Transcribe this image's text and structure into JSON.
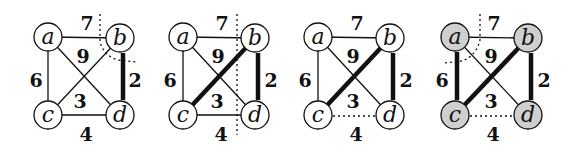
{
  "colors": {
    "stroke": "#111111",
    "node_fill": "#ffffff",
    "node_fill_in_tree": "#cfcfcf",
    "background": "#ffffff"
  },
  "nodes": [
    "a",
    "b",
    "c",
    "d"
  ],
  "edges": [
    {
      "id": "ab",
      "from": "a",
      "to": "b",
      "weight": "7"
    },
    {
      "id": "ad",
      "from": "a",
      "to": "d",
      "weight": "9"
    },
    {
      "id": "ac",
      "from": "a",
      "to": "c",
      "weight": "6"
    },
    {
      "id": "bd",
      "from": "b",
      "to": "d",
      "weight": "2"
    },
    {
      "id": "bc",
      "from": "b",
      "to": "c",
      "weight": "3"
    },
    {
      "id": "cd",
      "from": "c",
      "to": "d",
      "weight": "4"
    }
  ],
  "panels": [
    {
      "index": 1,
      "label_a": "a",
      "label_b": "b",
      "label_c": "c",
      "label_d": "d",
      "w_ab": "7",
      "w_ad": "9",
      "w_ac": "6",
      "w_bd": "2",
      "w_bc": "3",
      "w_cd": "4",
      "tree_edges": [
        "bd"
      ],
      "dotted_edges": [],
      "shaded_nodes": [],
      "cut": "around b"
    },
    {
      "index": 2,
      "label_a": "a",
      "label_b": "b",
      "label_c": "c",
      "label_d": "d",
      "w_ab": "7",
      "w_ad": "9",
      "w_ac": "6",
      "w_bd": "2",
      "w_bc": "3",
      "w_cd": "4",
      "tree_edges": [
        "bd",
        "bc"
      ],
      "dotted_edges": [],
      "shaded_nodes": [],
      "cut": "vertical line between {a,c} and {b,d}"
    },
    {
      "index": 3,
      "label_a": "a",
      "label_b": "b",
      "label_c": "c",
      "label_d": "d",
      "w_ab": "7",
      "w_ad": "9",
      "w_ac": "6",
      "w_bd": "2",
      "w_bc": "3",
      "w_cd": "4",
      "tree_edges": [
        "bd",
        "bc"
      ],
      "dotted_edges": [
        "cd"
      ],
      "shaded_nodes": [],
      "cut": "none"
    },
    {
      "index": 4,
      "label_a": "a",
      "label_b": "b",
      "label_c": "c",
      "label_d": "d",
      "w_ab": "7",
      "w_ad": "9",
      "w_ac": "6",
      "w_bd": "2",
      "w_bc": "3",
      "w_cd": "4",
      "tree_edges": [
        "bd",
        "bc",
        "ac"
      ],
      "dotted_edges": [
        "cd"
      ],
      "shaded_nodes": [
        "a",
        "b",
        "c",
        "d"
      ],
      "cut": "around a"
    }
  ]
}
